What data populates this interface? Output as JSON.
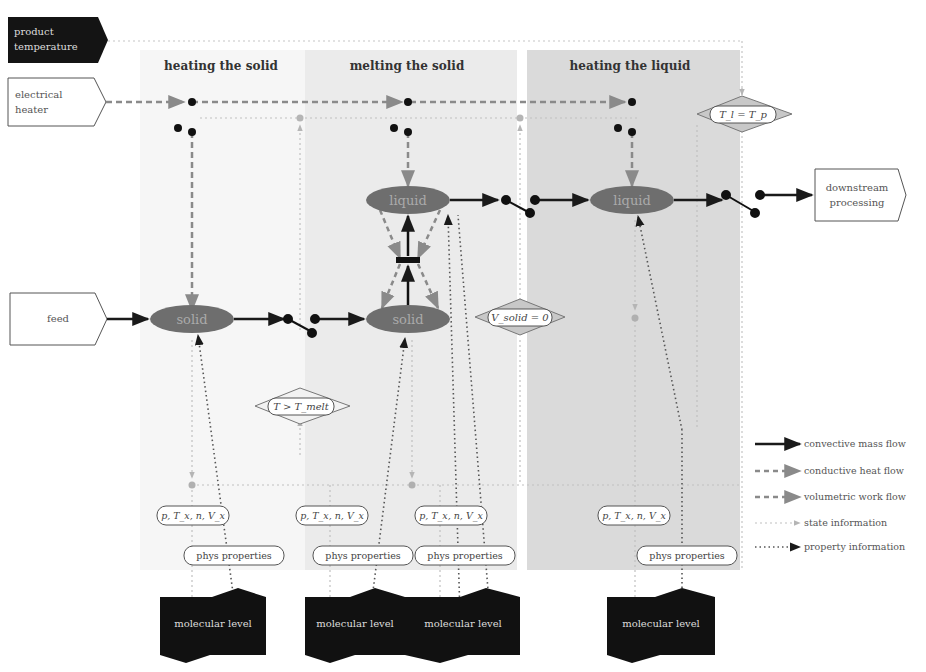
{
  "diagram": {
    "phases": [
      {
        "id": "heating-solid",
        "title": "heating the solid",
        "color": "#f7f7f7"
      },
      {
        "id": "melting-solid",
        "title": "melting the solid",
        "color": "#ececec"
      },
      {
        "id": "heating-liquid",
        "title": "heating the liquid",
        "color": "#dcdcdc"
      }
    ],
    "external_boxes": {
      "product_temperature": [
        "product",
        "temperature"
      ],
      "electrical_heater": [
        "electrical",
        "heater"
      ],
      "feed": "feed",
      "downstream": [
        "downstream",
        "processing"
      ]
    },
    "nodes": {
      "solid_1": "solid",
      "solid_2": "solid",
      "liquid_1": "liquid",
      "liquid_2": "liquid"
    },
    "conditions": {
      "melt": "T > T_melt",
      "vsolid": "V_solid = 0",
      "tl_tp": "T_l = T_p"
    },
    "state_pills": [
      "p, T_x, n, V_x",
      "p, T_x, n, V_x",
      "p, T_x, n, V_x",
      "p, T_x, n, V_x"
    ],
    "property_pills": [
      "phys properties",
      "phys properties",
      "phys properties",
      "phys properties"
    ],
    "molecular_boxes": [
      "molecular level",
      "molecular level",
      "molecular level",
      "molecular level"
    ],
    "legend": [
      {
        "label": "convective mass flow",
        "style": "solid-dark"
      },
      {
        "label": "conductive heat flow",
        "style": "dashed-gray"
      },
      {
        "label": "volumetric work flow",
        "style": "dashed-gray"
      },
      {
        "label": "state information",
        "style": "dotted-light"
      },
      {
        "label": "property information",
        "style": "dotted-dark"
      }
    ],
    "colors": {
      "node_fill": "#6e6e6e",
      "mass_flow": "#1a1a1a",
      "heat_flow": "#8a8a8a",
      "state_info": "#b5b5b5",
      "property_info": "#555555",
      "dark_box": "#111111"
    }
  }
}
